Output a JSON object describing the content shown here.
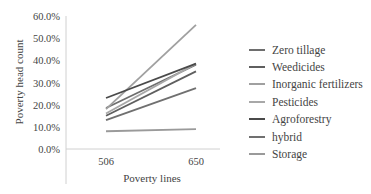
{
  "chart_data": {
    "type": "line",
    "title": "",
    "xlabel": "Poverty lines",
    "ylabel": "Poverty head count",
    "categories": [
      "506",
      "650"
    ],
    "ylim": [
      0,
      60
    ],
    "yticks": [
      "0.0%",
      "10.0%",
      "20.0%",
      "30.0%",
      "40.0%",
      "50.0%",
      "60.0%"
    ],
    "grid": false,
    "legend_position": "right",
    "series": [
      {
        "name": "Zero tillage",
        "values": [
          18.5,
          38.0
        ],
        "color": "#6e6e6e"
      },
      {
        "name": "Weedicides",
        "values": [
          15.0,
          35.0
        ],
        "color": "#5f5f5f"
      },
      {
        "name": "Inorganic fertilizers",
        "values": [
          18.0,
          56.0
        ],
        "color": "#a0a0a0"
      },
      {
        "name": "Pesticides",
        "values": [
          16.0,
          38.5
        ],
        "color": "#a8a8a8"
      },
      {
        "name": "Agroforestry",
        "values": [
          23.0,
          38.5
        ],
        "color": "#4a4a4a"
      },
      {
        "name": "hybrid",
        "values": [
          13.0,
          27.5
        ],
        "color": "#707070"
      },
      {
        "name": "Storage",
        "values": [
          8.0,
          9.0
        ],
        "color": "#9a9a9a"
      }
    ]
  }
}
